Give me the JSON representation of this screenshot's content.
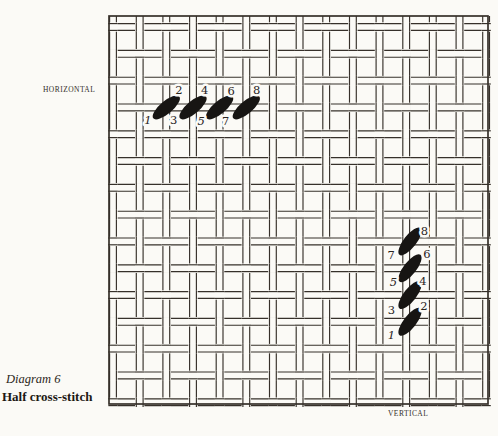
{
  "page": {
    "background": "#fbfaf6",
    "ink": "#36302a",
    "number_color": "#2a241e"
  },
  "labels": {
    "horizontal": "HORIZONTAL",
    "vertical": "VERTICAL"
  },
  "caption": {
    "title": "Diagram 6",
    "subtitle": "Half cross-stitch"
  },
  "canvas_grid": {
    "border": {
      "x1": 109,
      "y1": 16,
      "x2": 488,
      "y2": 404,
      "stroke_width": 1.7
    },
    "vertical_threads_x": [
      113,
      139.7,
      166.3,
      193,
      219.6,
      246.3,
      272.9,
      299.6,
      326.2,
      352.9,
      379.5,
      406.2,
      432.8,
      459.5,
      486.1
    ],
    "horizontal_threads_y": [
      27,
      53.8,
      80.6,
      107.4,
      134.2,
      161,
      187.8,
      214.6,
      241.4,
      268.2,
      295,
      321.8,
      348.6,
      375.4,
      402.2
    ],
    "thread_half_width": 3.4,
    "line_width": 1.15,
    "weave_rule": "horizontal thread passes over when (row+col) is even"
  },
  "stitches": {
    "color": "#171513",
    "number_font_size": 11.5,
    "groups": [
      {
        "name": "horizontal-row",
        "angle_deg": -40,
        "rx": 17,
        "ry": 6.3,
        "ovals": [
          {
            "cx": 166.3,
            "cy": 107.4
          },
          {
            "cx": 193.0,
            "cy": 107.4
          },
          {
            "cx": 219.6,
            "cy": 107.4
          },
          {
            "cx": 246.3,
            "cy": 107.4
          }
        ],
        "numbers": [
          {
            "text": "1",
            "x": 148.0,
            "y": 120.4,
            "italic": true
          },
          {
            "text": "2",
            "x": 179.0,
            "y": 90.4,
            "italic": false
          },
          {
            "text": "3",
            "x": 173.7,
            "y": 120.4,
            "italic": false
          },
          {
            "text": "4",
            "x": 204.7,
            "y": 90.4,
            "italic": false
          },
          {
            "text": "5",
            "x": 201.2,
            "y": 121.4,
            "italic": true
          },
          {
            "text": "6",
            "x": 231.2,
            "y": 91.4,
            "italic": false
          },
          {
            "text": "7",
            "x": 225.6,
            "y": 121.4,
            "italic": false
          },
          {
            "text": "8",
            "x": 256.6,
            "y": 90.4,
            "italic": false
          }
        ]
      },
      {
        "name": "vertical-column",
        "angle_deg": -52,
        "rx": 17,
        "ry": 6.3,
        "ovals": [
          {
            "cx": 410,
            "cy": 241.4
          },
          {
            "cx": 410,
            "cy": 268.2
          },
          {
            "cx": 410,
            "cy": 295.0
          },
          {
            "cx": 410,
            "cy": 321.8
          }
        ],
        "numbers": [
          {
            "text": "8",
            "x": 424.5,
            "y": 230.7,
            "italic": false
          },
          {
            "text": "7",
            "x": 391.2,
            "y": 254.7,
            "italic": false
          },
          {
            "text": "6",
            "x": 427.0,
            "y": 253.5,
            "italic": false
          },
          {
            "text": "5",
            "x": 393.5,
            "y": 281.7,
            "italic": true
          },
          {
            "text": "4",
            "x": 423.0,
            "y": 280.9,
            "italic": false
          },
          {
            "text": "3",
            "x": 391.5,
            "y": 310.0,
            "italic": false
          },
          {
            "text": "2",
            "x": 424.0,
            "y": 306.1,
            "italic": false
          },
          {
            "text": "1",
            "x": 391.5,
            "y": 334.8,
            "italic": true
          }
        ]
      }
    ]
  }
}
